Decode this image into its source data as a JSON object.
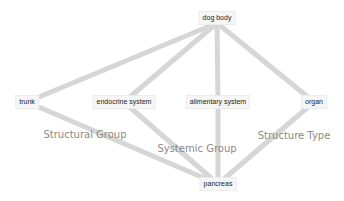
{
  "diagram": {
    "type": "hierarchy-graph",
    "edge_color": "#d6d6d6",
    "edge_width": 5,
    "nodes": [
      {
        "id": "dog_body",
        "label": "dog body",
        "x": 217,
        "y": 18
      },
      {
        "id": "trunk",
        "label": "trunk",
        "x": 27,
        "y": 102
      },
      {
        "id": "endocrine_system",
        "label": "endocrine system",
        "x": 124,
        "y": 102
      },
      {
        "id": "alimentary_system",
        "label": "alimentary system",
        "x": 218,
        "y": 102
      },
      {
        "id": "organ",
        "label": "organ",
        "x": 314,
        "y": 102
      },
      {
        "id": "pancreas",
        "label": "pancreas",
        "x": 218,
        "y": 184
      }
    ],
    "edges": [
      {
        "from": "dog_body",
        "to": "trunk"
      },
      {
        "from": "dog_body",
        "to": "endocrine_system"
      },
      {
        "from": "dog_body",
        "to": "alimentary_system"
      },
      {
        "from": "dog_body",
        "to": "organ"
      },
      {
        "from": "trunk",
        "to": "pancreas",
        "group": "Structural Group"
      },
      {
        "from": "endocrine_system",
        "to": "pancreas",
        "group": "Systemic Group"
      },
      {
        "from": "alimentary_system",
        "to": "pancreas",
        "group": "Systemic Group"
      },
      {
        "from": "organ",
        "to": "pancreas",
        "group": "Structure Type"
      }
    ],
    "group_labels": [
      {
        "label": "Structural Group",
        "x": 85,
        "y": 134
      },
      {
        "label": "Systemic Group",
        "x": 197,
        "y": 148
      },
      {
        "label": "Structure Type",
        "x": 294,
        "y": 135
      }
    ]
  }
}
